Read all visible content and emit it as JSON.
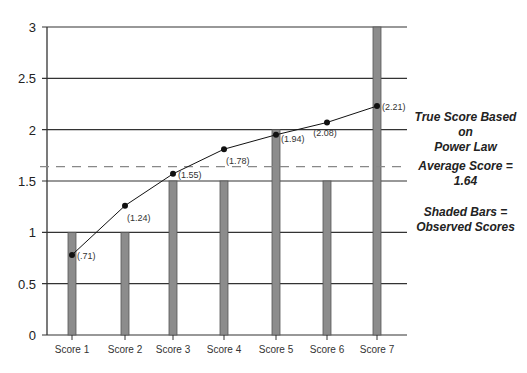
{
  "chart_data": {
    "type": "bar",
    "title": "",
    "xlabel": "",
    "ylabel": "",
    "ylim": [
      0,
      3
    ],
    "yticks": [
      "0",
      "0.5",
      "1",
      "1.5",
      "2",
      "2.5",
      "3"
    ],
    "grid": true,
    "categories": [
      "Score 1",
      "Score 2",
      "Score 3",
      "Score 4",
      "Score 5",
      "Score 6",
      "Score 7"
    ],
    "series": [
      {
        "name": "Observed Scores",
        "kind": "bar",
        "color": "#8c8c8c",
        "values": [
          1,
          1,
          1.5,
          1.5,
          2,
          1.5,
          3
        ]
      },
      {
        "name": "True Score Based on Power Law",
        "kind": "line",
        "color": "#111111",
        "values": [
          0.71,
          1.24,
          1.55,
          1.78,
          1.94,
          2.08,
          2.21
        ],
        "labels": [
          "(.71)",
          "(1.24)",
          "(1.55)",
          "(1.78)",
          "(1.94)",
          "(2.08)",
          "(2.21)"
        ]
      }
    ],
    "reference_line": {
      "name": "Average Score",
      "value": 1.64,
      "style": "dashed",
      "color": "#888888"
    },
    "annotations": [
      "True Score Based on Power Law",
      "Average Score = 1.64",
      "Shaded Bars = Observed Scores"
    ]
  },
  "legend": {
    "line_label_1": "True Score Based on",
    "line_label_2": "Power Law",
    "average_label": "Average Score = 1.64",
    "bars_label_1": "Shaded Bars =",
    "bars_label_2": "Observed Scores"
  }
}
